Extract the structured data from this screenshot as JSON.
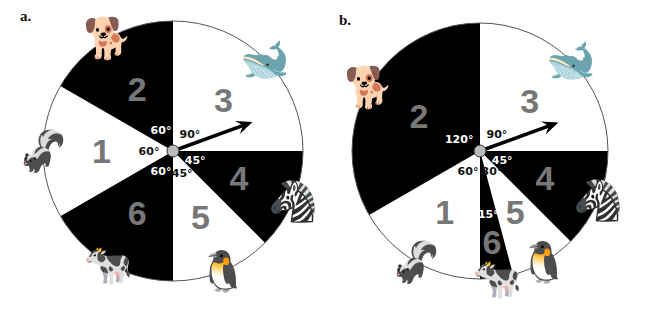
{
  "panels": [
    {
      "label": "a.",
      "center": [
        173,
        151
      ],
      "radius": 130,
      "sectors": [
        {
          "number": "3",
          "animal": "orca",
          "glyph": "🐋",
          "start": 0,
          "end": 90,
          "angle_label": "90°",
          "fill": "#ffffff"
        },
        {
          "number": "4",
          "animal": "zebra",
          "glyph": "🦓",
          "start": 90,
          "end": 135,
          "angle_label": "45°",
          "fill": "#000000"
        },
        {
          "number": "5",
          "animal": "penguin",
          "glyph": "🐧",
          "start": 135,
          "end": 180,
          "angle_label": "45°",
          "fill": "#ffffff"
        },
        {
          "number": "6",
          "animal": "cow",
          "glyph": "🐄",
          "start": 180,
          "end": 240,
          "angle_label": "60°",
          "fill": "#000000"
        },
        {
          "number": "1",
          "animal": "skunk",
          "glyph": "🦨",
          "start": 240,
          "end": 300,
          "angle_label": "60°",
          "fill": "#ffffff"
        },
        {
          "number": "2",
          "animal": "dalmatian",
          "glyph": "🐕",
          "start": 300,
          "end": 360,
          "angle_label": "60°",
          "fill": "#000000"
        }
      ],
      "arrow_angle": 70
    },
    {
      "label": "b.",
      "center": [
        480,
        151
      ],
      "radius": 128,
      "sectors": [
        {
          "number": "3",
          "animal": "orca",
          "glyph": "🐋",
          "start": 0,
          "end": 90,
          "angle_label": "90°",
          "fill": "#ffffff"
        },
        {
          "number": "4",
          "animal": "zebra",
          "glyph": "🦓",
          "start": 90,
          "end": 135,
          "angle_label": "45°",
          "fill": "#000000"
        },
        {
          "number": "5",
          "animal": "penguin",
          "glyph": "🐧",
          "start": 135,
          "end": 165,
          "angle_label": "30°",
          "fill": "#ffffff"
        },
        {
          "number": "6",
          "animal": "cow",
          "glyph": "🐄",
          "start": 165,
          "end": 180,
          "angle_label": "15°",
          "fill": "#000000"
        },
        {
          "number": "1",
          "animal": "skunk",
          "glyph": "🦨",
          "start": 180,
          "end": 240,
          "angle_label": "60°",
          "fill": "#ffffff"
        },
        {
          "number": "2",
          "animal": "dalmatian",
          "glyph": "🐕",
          "start": 240,
          "end": 360,
          "angle_label": "120°",
          "fill": "#000000"
        }
      ],
      "arrow_angle": 70
    }
  ],
  "colors": {
    "number": "#777777",
    "outline": "#555555",
    "hub": "#bbbbbb"
  }
}
